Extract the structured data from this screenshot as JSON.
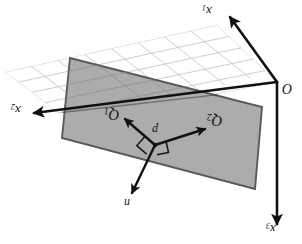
{
  "figure": {
    "kind": "3d-geometry-diagram",
    "orientation_note": "upside-down scan",
    "background_color": "#ffffff",
    "plane_fill_color": "#a8a8a8",
    "plane_edge_color": "#555555",
    "grid_line_color": "#b9b9b9",
    "axis_color": "#111111",
    "vector_color": "#111111",
    "labels": {
      "axis_x1": "x",
      "axis_x1_sub": "1",
      "axis_x2": "x",
      "axis_x2_sub": "2",
      "axis_x3": "x",
      "axis_x3_sub": "3",
      "origin": "O",
      "point": "p",
      "vector_q1": "Q",
      "vector_q1_sub": "1",
      "vector_q2": "Q",
      "vector_q2_sub": "2",
      "normal": "n"
    },
    "grid": {
      "cols": 8,
      "rows": 5
    },
    "geometry": {
      "origin_px": [
        277,
        82
      ],
      "point_p_px": [
        155,
        145
      ],
      "axis_x1_tip_px": [
        228,
        14
      ],
      "axis_x2_tip_px": [
        32,
        113
      ],
      "axis_x3_tip_px": [
        277,
        228
      ],
      "q1_tip_px": [
        123,
        117
      ],
      "q2_tip_px": [
        208,
        128
      ],
      "n_tip_px": [
        131,
        196
      ],
      "gray_plane_px": [
        [
          70,
          58
        ],
        [
          262,
          107
        ],
        [
          255,
          189
        ],
        [
          62,
          138
        ]
      ],
      "grid_quad_px": [
        [
          5,
          72
        ],
        [
          217,
          25
        ],
        [
          277,
          82
        ],
        [
          72,
          123
        ]
      ]
    }
  }
}
